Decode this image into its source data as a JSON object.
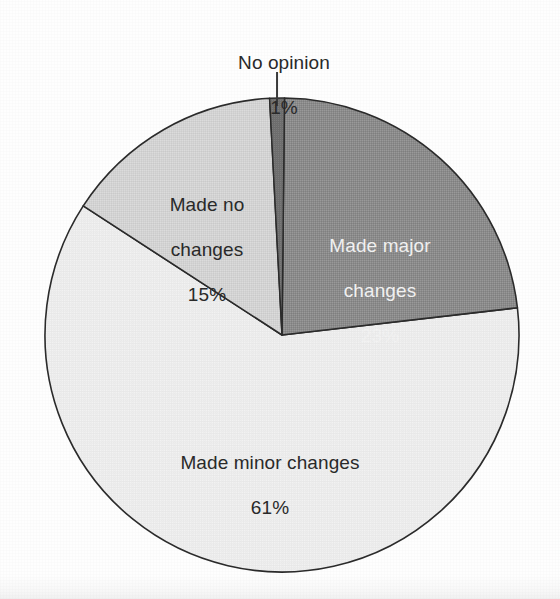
{
  "chart_data": {
    "type": "pie",
    "title": "",
    "subtitle": "",
    "xlabel": "",
    "ylabel": "",
    "legend_position": "none",
    "grid": false,
    "units": "percent",
    "total": 100,
    "start_angle_deg": -3,
    "direction": "clockwise",
    "categories": [
      "No opinion",
      "Made major changes",
      "Made minor changes",
      "Made no changes"
    ],
    "values": [
      1,
      23,
      61,
      15
    ],
    "slices": [
      {
        "name": "no-opinion",
        "label": "No opinion",
        "value": 1,
        "value_label": "1%",
        "color": "#6e6e6e",
        "label_color": "#2a2a2a",
        "label_placement": "outside-leader",
        "label_x": 284,
        "label_y": 30,
        "leader": true
      },
      {
        "name": "made-major-changes",
        "label": "Made major\nchanges",
        "value": 23,
        "value_label": "23%",
        "color": "#8c8c8c",
        "label_color": "#f2f2f2",
        "label_placement": "inside",
        "label_x": 380,
        "label_y": 213,
        "leader": false
      },
      {
        "name": "made-minor-changes",
        "label": "Made minor changes",
        "value": 61,
        "value_label": "61%",
        "color": "#ececec",
        "label_color": "#2a2a2a",
        "label_placement": "inside",
        "label_x": 270,
        "label_y": 430,
        "leader": false
      },
      {
        "name": "made-no-changes",
        "label": "Made no\nchanges",
        "value": 15,
        "value_label": "15%",
        "color": "#d4d4d4",
        "label_color": "#2a2a2a",
        "label_placement": "inside",
        "label_x": 207,
        "label_y": 172,
        "leader": false
      }
    ],
    "geometry": {
      "center_x": 282,
      "center_y": 335,
      "radius": 237,
      "stroke_color": "#2b2b2b",
      "stroke_width": 1.6,
      "background": "#fefefe"
    }
  },
  "labels": {
    "no_opinion": {
      "line1": "No opinion",
      "line2": "1%"
    },
    "made_major_changes": {
      "line1": "Made major",
      "line2": "changes",
      "line3": "23%"
    },
    "made_no_changes": {
      "line1": "Made no",
      "line2": "changes",
      "line3": "15%"
    },
    "made_minor_changes": {
      "line1": "Made minor changes",
      "line2": "61%"
    }
  }
}
